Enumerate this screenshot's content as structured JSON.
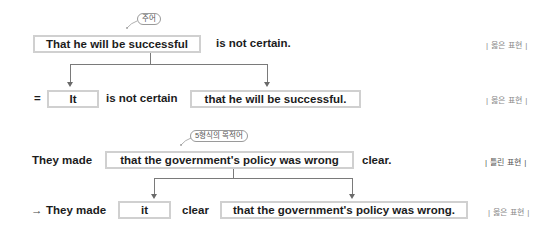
{
  "example1": {
    "callout": "주어",
    "original": {
      "subject_clause": "That he will be successful",
      "predicate": "is not certain.",
      "judgement": "| 옳은 표현 |"
    },
    "rewritten": {
      "equals_sign": "=",
      "dummy_subject": "It",
      "predicate": "is not certain",
      "moved_clause": "that he will be successful.",
      "judgement": "| 옳은 표현 |"
    }
  },
  "example2": {
    "callout": "5형식의 목적어",
    "original": {
      "lead": "They made",
      "object_clause": "that the government's policy was wrong",
      "complement": "clear.",
      "judgement": "| 틀린 표현 |"
    },
    "rewritten": {
      "arrow": "→",
      "lead": "They made",
      "dummy_object": "it",
      "complement": "clear",
      "moved_clause": "that the government's policy was wrong.",
      "judgement": "| 옳은 표현 |"
    }
  },
  "colors": {
    "box_border": "#d0d0d0",
    "connector": "#7a7a7a",
    "text": "#1c1c1c",
    "label": "#8a8a8a"
  }
}
